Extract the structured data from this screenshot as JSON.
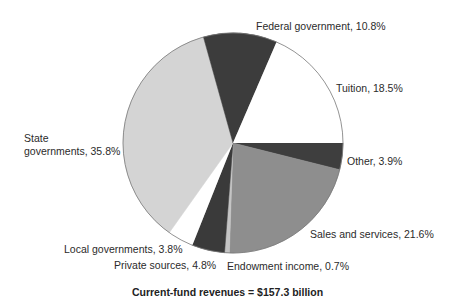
{
  "chart_data": {
    "type": "pie",
    "title": "",
    "caption": "Current-fund revenues = $157.3 billion",
    "total": "$157.3 billion",
    "start_angle_deg": 0,
    "direction": "clockwise",
    "center": [
      233,
      143
    ],
    "radius": 110,
    "slices": [
      {
        "label": "Other",
        "value": 3.9,
        "display": "Other, 3.9%",
        "color": "#3e3e3e"
      },
      {
        "label": "Sales and services",
        "value": 21.6,
        "display": "Sales and services, 21.6%",
        "color": "#8e8e8e"
      },
      {
        "label": "Endowment income",
        "value": 0.7,
        "display": "Endowment income, 0.7%",
        "color": "#c4c4c4"
      },
      {
        "label": "Private sources",
        "value": 4.8,
        "display": "Private sources, 4.8%",
        "color": "#3a3a3a"
      },
      {
        "label": "Local governments",
        "value": 3.8,
        "display": "Local governments, 3.8%",
        "color": "#ffffff"
      },
      {
        "label": "State governments",
        "value": 35.8,
        "display_line1": "State",
        "display_line2": "governments, 35.8%",
        "color": "#d4d4d4"
      },
      {
        "label": "Federal government",
        "value": 10.8,
        "display": "Federal government, 10.8%",
        "color": "#3c3c3c"
      },
      {
        "label": "Tuition",
        "value": 18.5,
        "display": "Tuition, 18.5%",
        "color": "#ffffff"
      }
    ],
    "outline_color": "#777777"
  }
}
